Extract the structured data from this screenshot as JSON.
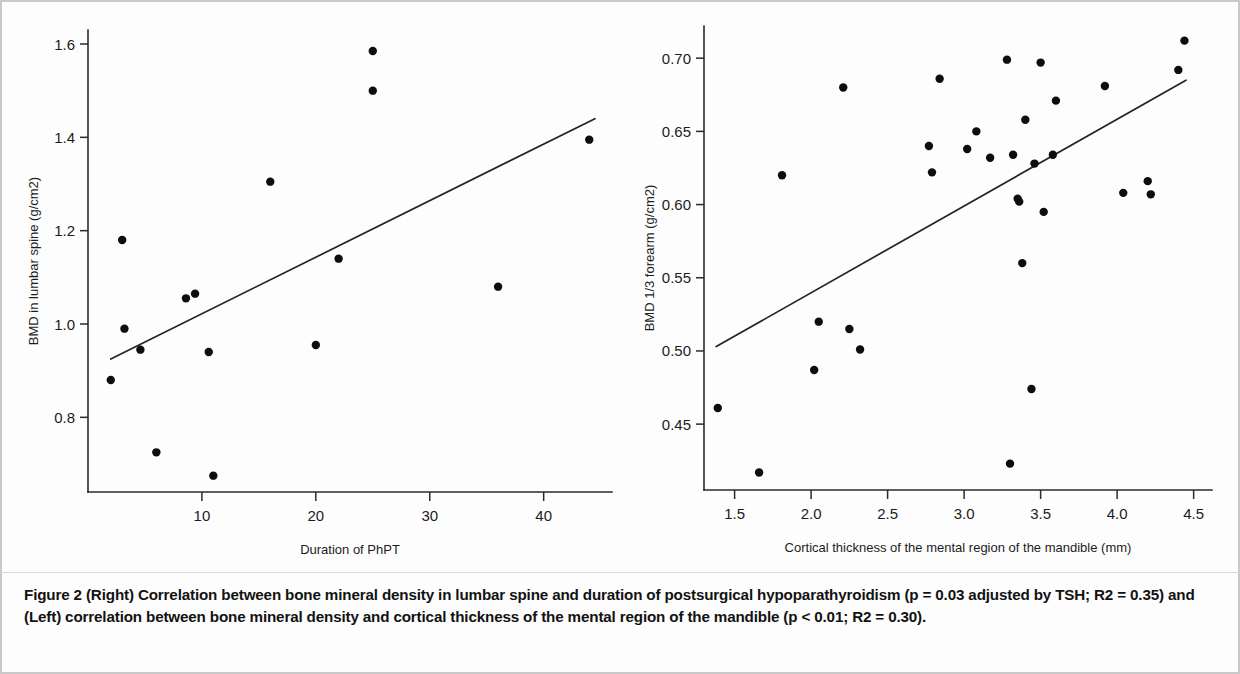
{
  "figure": {
    "label": "Figure 2",
    "caption": "(Right) Correlation between bone mineral density in lumbar spine and duration of postsurgical hypoparathyroidism (p = 0.03 adjusted by TSH; R2 = 0.35) and (Left) correlation between bone mineral density and cortical thickness of the mental region of the mandible (p < 0.01; R2 = 0.30)."
  },
  "chart_data": [
    {
      "type": "scatter",
      "panel": "left",
      "title": "",
      "xlabel": "Duration of PhPT",
      "ylabel": "BMD in lumbar spine (g/cm2)",
      "xlim": [
        0,
        46
      ],
      "ylim": [
        0.64,
        1.63
      ],
      "xticks": [
        10,
        20,
        30,
        40
      ],
      "xtick_labels": [
        "10",
        "20",
        "30",
        "40"
      ],
      "yticks": [
        0.8,
        1.0,
        1.2,
        1.4,
        1.6
      ],
      "ytick_labels": [
        "0.8",
        "1.0",
        "1.2",
        "1.4",
        "1.6"
      ],
      "grid": false,
      "legend": "none",
      "points": [
        {
          "x": 2.0,
          "y": 0.88
        },
        {
          "x": 3.0,
          "y": 1.18
        },
        {
          "x": 3.2,
          "y": 0.99
        },
        {
          "x": 4.6,
          "y": 0.945
        },
        {
          "x": 6.0,
          "y": 0.725
        },
        {
          "x": 8.6,
          "y": 1.055
        },
        {
          "x": 9.4,
          "y": 1.065
        },
        {
          "x": 10.6,
          "y": 0.94
        },
        {
          "x": 11.0,
          "y": 0.675
        },
        {
          "x": 16.0,
          "y": 1.305
        },
        {
          "x": 20.0,
          "y": 0.955
        },
        {
          "x": 22.0,
          "y": 1.14
        },
        {
          "x": 25.0,
          "y": 1.585
        },
        {
          "x": 25.0,
          "y": 1.5
        },
        {
          "x": 36.0,
          "y": 1.08
        },
        {
          "x": 44.0,
          "y": 1.395
        }
      ],
      "fit_line": {
        "x1": 2.0,
        "y1": 0.925,
        "x2": 44.5,
        "y2": 1.44
      },
      "stats": {
        "p": "0.03",
        "r2": "0.35"
      }
    },
    {
      "type": "scatter",
      "panel": "right",
      "title": "",
      "xlabel": "Cortical thickness of the mental region of the mandible (mm)",
      "ylabel": "BMD 1/3 forearm (g/cm2)",
      "xlim": [
        1.3,
        4.62
      ],
      "ylim": [
        0.405,
        0.722
      ],
      "xticks": [
        1.5,
        2.0,
        2.5,
        3.0,
        3.5,
        4.0,
        4.5
      ],
      "xtick_labels": [
        "1.5",
        "2.0",
        "2.5",
        "3.0",
        "3.5",
        "4.0",
        "4.5"
      ],
      "yticks": [
        0.45,
        0.5,
        0.55,
        0.6,
        0.65,
        0.7
      ],
      "ytick_labels": [
        "0.45",
        "0.50",
        "0.55",
        "0.60",
        "0.65",
        "0.70"
      ],
      "grid": false,
      "legend": "none",
      "points": [
        {
          "x": 1.39,
          "y": 0.461
        },
        {
          "x": 1.66,
          "y": 0.417
        },
        {
          "x": 1.81,
          "y": 0.62
        },
        {
          "x": 2.02,
          "y": 0.487
        },
        {
          "x": 2.05,
          "y": 0.52
        },
        {
          "x": 2.21,
          "y": 0.68
        },
        {
          "x": 2.25,
          "y": 0.515
        },
        {
          "x": 2.32,
          "y": 0.501
        },
        {
          "x": 2.77,
          "y": 0.64
        },
        {
          "x": 2.79,
          "y": 0.622
        },
        {
          "x": 2.84,
          "y": 0.686
        },
        {
          "x": 3.02,
          "y": 0.638
        },
        {
          "x": 3.08,
          "y": 0.65
        },
        {
          "x": 3.17,
          "y": 0.632
        },
        {
          "x": 3.28,
          "y": 0.699
        },
        {
          "x": 3.3,
          "y": 0.423
        },
        {
          "x": 3.32,
          "y": 0.634
        },
        {
          "x": 3.35,
          "y": 0.604
        },
        {
          "x": 3.36,
          "y": 0.602
        },
        {
          "x": 3.38,
          "y": 0.56
        },
        {
          "x": 3.4,
          "y": 0.658
        },
        {
          "x": 3.44,
          "y": 0.474
        },
        {
          "x": 3.46,
          "y": 0.628
        },
        {
          "x": 3.5,
          "y": 0.697
        },
        {
          "x": 3.52,
          "y": 0.595
        },
        {
          "x": 3.58,
          "y": 0.634
        },
        {
          "x": 3.6,
          "y": 0.671
        },
        {
          "x": 3.92,
          "y": 0.681
        },
        {
          "x": 4.04,
          "y": 0.608
        },
        {
          "x": 4.2,
          "y": 0.616
        },
        {
          "x": 4.22,
          "y": 0.607
        },
        {
          "x": 4.4,
          "y": 0.692
        },
        {
          "x": 4.44,
          "y": 0.712
        }
      ],
      "fit_line": {
        "x1": 1.38,
        "y1": 0.503,
        "x2": 4.45,
        "y2": 0.685
      },
      "stats": {
        "p": "< 0.01",
        "r2": "0.30"
      }
    }
  ]
}
